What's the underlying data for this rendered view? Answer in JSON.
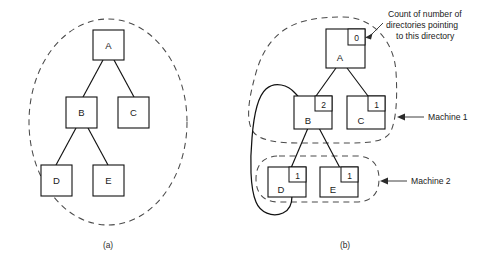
{
  "figure": {
    "panels": [
      {
        "id": "a",
        "caption": "(a)",
        "enclosure": {
          "shape": "ellipse",
          "label": ""
        },
        "nodes": [
          {
            "id": "A",
            "label": "A"
          },
          {
            "id": "B",
            "label": "B"
          },
          {
            "id": "C",
            "label": "C"
          },
          {
            "id": "D",
            "label": "D"
          },
          {
            "id": "E",
            "label": "E"
          }
        ],
        "edges": [
          {
            "from": "A",
            "to": "B"
          },
          {
            "from": "A",
            "to": "C"
          },
          {
            "from": "B",
            "to": "D"
          },
          {
            "from": "B",
            "to": "E"
          }
        ]
      },
      {
        "id": "b",
        "caption": "(b)",
        "nodes": [
          {
            "id": "A",
            "label": "A",
            "count": "0"
          },
          {
            "id": "B",
            "label": "B",
            "count": "2"
          },
          {
            "id": "C",
            "label": "C",
            "count": "1"
          },
          {
            "id": "D",
            "label": "D",
            "count": "1"
          },
          {
            "id": "E",
            "label": "E",
            "count": "1"
          }
        ],
        "edges": [
          {
            "from": "A",
            "to": "B"
          },
          {
            "from": "A",
            "to": "C"
          },
          {
            "from": "B",
            "to": "D"
          },
          {
            "from": "B",
            "to": "E"
          },
          {
            "from": "D",
            "to": "B",
            "style": "curved-backlink"
          }
        ],
        "enclosures": [
          {
            "id": "machine-1",
            "label": "Machine 1",
            "shape": "blob",
            "contains": [
              "A",
              "B",
              "C"
            ]
          },
          {
            "id": "machine-2",
            "label": "Machine 2",
            "shape": "stadium",
            "contains": [
              "D",
              "E"
            ]
          }
        ],
        "annotations": [
          {
            "id": "count-callout",
            "lines": [
              "Count of number of",
              "directories pointing",
              "to this directory"
            ],
            "points_to": "A.count"
          }
        ]
      }
    ]
  }
}
